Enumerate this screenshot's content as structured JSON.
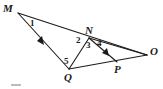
{
  "figure": {
    "kind": "geometry-diagram",
    "background_color": "#ffffff",
    "stroke_color": "#1b1b1b",
    "label_color": "#1b1b1b",
    "width": 163,
    "height": 89
  },
  "points": [
    {
      "id": "M",
      "label": "M",
      "x": 18,
      "y": 13,
      "label_x": 3,
      "label_y": 3
    },
    {
      "id": "N",
      "label": "N",
      "x": 89,
      "y": 38,
      "label_x": 85,
      "label_y": 25
    },
    {
      "id": "O",
      "label": "O",
      "x": 147,
      "y": 55,
      "label_x": 150,
      "label_y": 46
    },
    {
      "id": "P",
      "label": "P",
      "x": 117,
      "y": 62,
      "label_x": 114,
      "label_y": 64
    },
    {
      "id": "Q",
      "label": "Q",
      "x": 69,
      "y": 69,
      "label_x": 64,
      "label_y": 72
    }
  ],
  "segments": [
    {
      "id": "MO",
      "from": "M",
      "to": "O",
      "through": [
        "N"
      ],
      "arrow": false
    },
    {
      "id": "MQ",
      "from": "M",
      "to": "Q",
      "arrow": true,
      "arrow_t": 0.52
    },
    {
      "id": "QO",
      "from": "Q",
      "to": "O",
      "through": [
        "P"
      ],
      "arrow": false
    },
    {
      "id": "NQ",
      "from": "N",
      "to": "Q",
      "arrow": false
    },
    {
      "id": "NP",
      "from": "N",
      "to": "P",
      "arrow": true,
      "arrow_t": 0.72
    },
    {
      "id": "NO",
      "from": "N",
      "to": "O",
      "arrow": false
    }
  ],
  "angles": [
    {
      "id": "a1",
      "label": "1",
      "x": 30,
      "y": 19
    },
    {
      "id": "a2",
      "label": "2",
      "x": 76,
      "y": 36
    },
    {
      "id": "a3",
      "label": "3",
      "x": 86,
      "y": 41
    },
    {
      "id": "a4",
      "label": "4",
      "x": 97,
      "y": 39
    },
    {
      "id": "a5",
      "label": "5",
      "x": 64,
      "y": 57
    }
  ]
}
